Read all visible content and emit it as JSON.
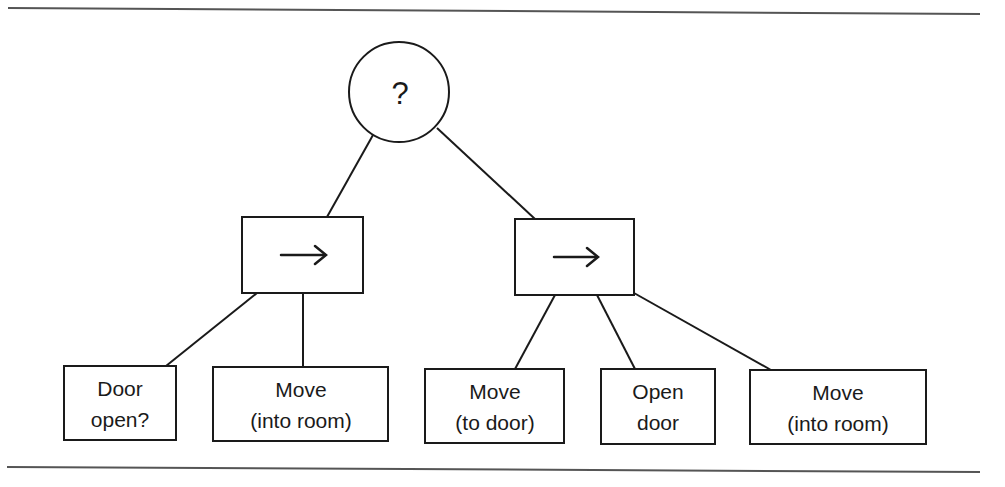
{
  "diagram": {
    "type": "behavior-tree",
    "colors": {
      "stroke": "#1a1a1a",
      "rule": "#555555",
      "background": "#ffffff"
    },
    "root": {
      "kind": "selector",
      "icon": "question-mark-icon",
      "label": "?"
    },
    "sequences": [
      {
        "kind": "sequence",
        "icon": "arrow-right-icon",
        "label": "→"
      },
      {
        "kind": "sequence",
        "icon": "arrow-right-icon",
        "label": "→"
      }
    ],
    "leaves": [
      {
        "parent": 0,
        "lines": [
          "Door",
          "open?"
        ]
      },
      {
        "parent": 0,
        "lines": [
          "Move",
          "(into room)"
        ]
      },
      {
        "parent": 1,
        "lines": [
          "Move",
          "(to door)"
        ]
      },
      {
        "parent": 1,
        "lines": [
          "Open",
          "door"
        ]
      },
      {
        "parent": 1,
        "lines": [
          "Move",
          "(into room)"
        ]
      }
    ]
  }
}
